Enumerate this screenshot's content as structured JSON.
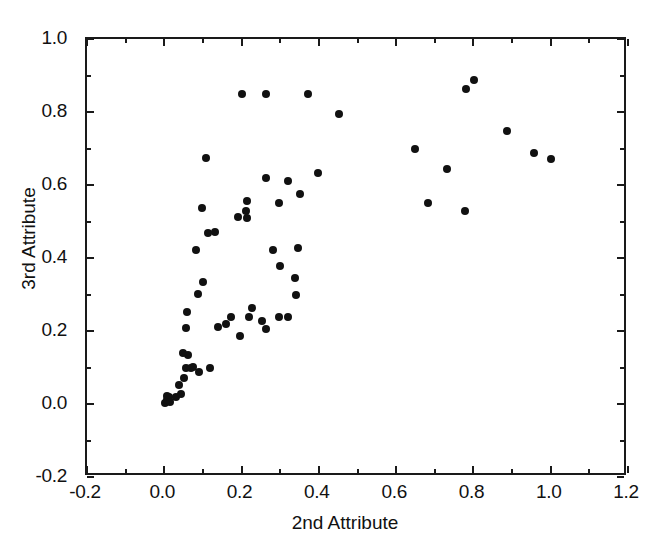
{
  "chart_data": {
    "type": "scatter",
    "title": "",
    "xlabel": "2nd Attribute",
    "ylabel": "3rd Attribute",
    "xlim": [
      -0.2,
      1.2
    ],
    "ylim": [
      -0.2,
      1.0
    ],
    "xticks": [
      -0.2,
      0.0,
      0.2,
      0.4,
      0.6,
      0.8,
      1.0,
      1.2
    ],
    "xtick_labels": [
      "-0.2",
      "0.0",
      "0.2",
      "0.4",
      "0.6",
      "0.8",
      "1.0",
      "1.2"
    ],
    "yticks": [
      -0.2,
      0.0,
      0.2,
      0.4,
      0.6,
      0.8,
      1.0
    ],
    "ytick_labels": [
      "-0.2",
      "0.0",
      "0.2",
      "0.4",
      "0.6",
      "0.8",
      "1.0"
    ],
    "grid": false,
    "legend": false,
    "marker": "filled-circle",
    "marker_color": "#111111",
    "marker_size_px": 8,
    "n_points": 62,
    "points": [
      [
        0.003,
        0.004
      ],
      [
        0.008,
        0.01
      ],
      [
        0.012,
        0.018
      ],
      [
        0.006,
        0.022
      ],
      [
        0.015,
        0.006
      ],
      [
        0.03,
        0.02
      ],
      [
        0.042,
        0.028
      ],
      [
        0.038,
        0.052
      ],
      [
        0.05,
        0.072
      ],
      [
        0.055,
        0.098
      ],
      [
        0.07,
        0.1
      ],
      [
        0.075,
        0.102
      ],
      [
        0.09,
        0.088
      ],
      [
        0.062,
        0.135
      ],
      [
        0.118,
        0.098
      ],
      [
        0.055,
        0.208
      ],
      [
        0.058,
        0.252
      ],
      [
        0.14,
        0.212
      ],
      [
        0.16,
        0.218
      ],
      [
        0.196,
        0.185
      ],
      [
        0.218,
        0.238
      ],
      [
        0.228,
        0.262
      ],
      [
        0.252,
        0.228
      ],
      [
        0.32,
        0.238
      ],
      [
        0.342,
        0.298
      ],
      [
        0.3,
        0.378
      ],
      [
        0.338,
        0.345
      ],
      [
        0.282,
        0.422
      ],
      [
        0.345,
        0.428
      ],
      [
        0.082,
        0.422
      ],
      [
        0.112,
        0.468
      ],
      [
        0.13,
        0.47
      ],
      [
        0.098,
        0.538
      ],
      [
        0.19,
        0.512
      ],
      [
        0.215,
        0.51
      ],
      [
        0.212,
        0.53
      ],
      [
        0.215,
        0.555
      ],
      [
        0.108,
        0.675
      ],
      [
        0.262,
        0.618
      ],
      [
        0.32,
        0.61
      ],
      [
        0.298,
        0.552
      ],
      [
        0.352,
        0.575
      ],
      [
        0.398,
        0.632
      ],
      [
        0.2,
        0.848
      ],
      [
        0.262,
        0.848
      ],
      [
        0.372,
        0.848
      ],
      [
        0.452,
        0.795
      ],
      [
        0.648,
        0.698
      ],
      [
        0.682,
        0.55
      ],
      [
        0.732,
        0.645
      ],
      [
        0.778,
        0.53
      ],
      [
        0.782,
        0.862
      ],
      [
        0.802,
        0.888
      ],
      [
        0.888,
        0.748
      ],
      [
        0.958,
        0.688
      ],
      [
        1.0,
        0.672
      ],
      [
        0.088,
        0.302
      ],
      [
        0.1,
        0.335
      ],
      [
        0.048,
        0.14
      ],
      [
        0.172,
        0.238
      ],
      [
        0.262,
        0.205
      ],
      [
        0.298,
        0.238
      ]
    ]
  },
  "axes": {
    "frame_color": "#1a1a1a",
    "background": "#ffffff"
  }
}
